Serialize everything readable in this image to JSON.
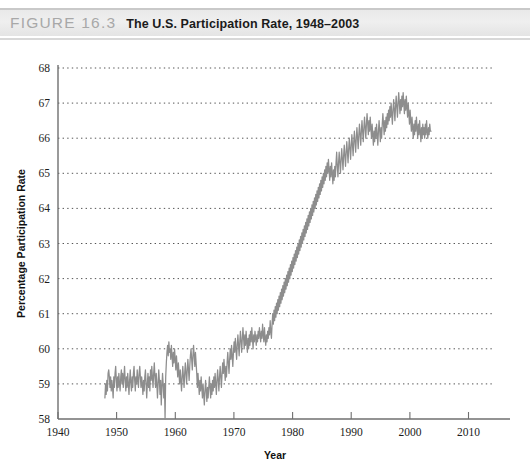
{
  "figure": {
    "label": "FIGURE 16.3",
    "title": "The U.S. Participation Rate, 1948–2003"
  },
  "colors": {
    "line": "#8d8d8d",
    "axis": "#6f6f6f",
    "grid": "#555555",
    "header_bg": "#ebebeb",
    "label_gray": "#a8a8a8",
    "text": "#1c1c1c"
  },
  "chart_data": {
    "type": "line",
    "title": "The U.S. Participation Rate, 1948–2003",
    "xlabel": "Year",
    "ylabel": "Percentage Participation Rate",
    "xlim": [
      1940,
      2014
    ],
    "ylim": [
      58,
      68
    ],
    "xticks": [
      1940,
      1950,
      1960,
      1970,
      1980,
      1990,
      2000,
      2010
    ],
    "yticks": [
      58,
      59,
      60,
      61,
      62,
      63,
      64,
      65,
      66,
      67,
      68
    ],
    "grid": "horizontal-dotted",
    "legend": "none",
    "series": [
      {
        "name": "U.S. Labor Force Participation Rate",
        "units": "percent",
        "x_start": 1948.0,
        "x_end": 2003.6,
        "x_step": 0.0833,
        "values": [
          58.6,
          59.0,
          58.7,
          59.1,
          58.8,
          59.3,
          59.4,
          59.2,
          58.9,
          59.2,
          58.8,
          59.1,
          58.9,
          58.6,
          59.2,
          58.9,
          59.3,
          59.5,
          59.1,
          58.8,
          59.2,
          58.9,
          59.3,
          59.0,
          58.8,
          59.2,
          59.4,
          59.0,
          59.3,
          58.9,
          59.2,
          59.5,
          59.1,
          58.8,
          59.2,
          58.9,
          59.3,
          59.0,
          58.7,
          59.1,
          59.4,
          59.0,
          58.8,
          59.2,
          58.9,
          59.3,
          59.5,
          59.1,
          58.8,
          59.2,
          59.0,
          59.4,
          59.1,
          58.9,
          59.3,
          59.5,
          59.2,
          58.9,
          59.2,
          59.0,
          58.7,
          59.1,
          58.8,
          59.2,
          59.4,
          59.0,
          58.6,
          59.0,
          59.3,
          58.9,
          59.2,
          58.8,
          59.4,
          59.1,
          59.5,
          59.2,
          58.9,
          59.3,
          59.6,
          59.2,
          58.9,
          59.3,
          59.0,
          58.6,
          59.0,
          59.4,
          59.1,
          58.7,
          59.1,
          58.4,
          58.9,
          59.3,
          59.0,
          58.6,
          59.0,
          58.0,
          59.2,
          59.6,
          59.9,
          60.1,
          59.8,
          60.2,
          59.9,
          60.0,
          59.7,
          60.1,
          59.8,
          59.5,
          59.9,
          59.6,
          60.0,
          59.7,
          59.4,
          59.8,
          59.5,
          59.2,
          59.6,
          59.3,
          59.0,
          59.4,
          59.1,
          58.8,
          59.2,
          59.5,
          59.2,
          58.9,
          59.3,
          59.6,
          59.3,
          59.0,
          59.4,
          59.7,
          59.4,
          59.1,
          59.5,
          59.8,
          60.0,
          59.7,
          59.4,
          59.8,
          60.1,
          59.8,
          59.5,
          59.9,
          59.6,
          59.3,
          58.9,
          59.3,
          59.0,
          58.7,
          59.1,
          58.8,
          59.2,
          58.9,
          58.6,
          59.0,
          58.7,
          58.4,
          58.8,
          59.1,
          58.8,
          58.5,
          58.9,
          58.6,
          58.9,
          59.2,
          58.9,
          58.6,
          59.0,
          58.7,
          59.1,
          58.8,
          59.2,
          58.9,
          59.3,
          59.0,
          58.7,
          59.1,
          59.4,
          59.1,
          58.8,
          59.2,
          59.5,
          59.2,
          58.9,
          59.3,
          59.6,
          59.3,
          59.7,
          59.4,
          59.1,
          59.5,
          59.2,
          59.6,
          59.9,
          59.6,
          59.3,
          59.7,
          60.0,
          59.7,
          60.1,
          59.8,
          59.5,
          59.9,
          60.2,
          59.9,
          60.3,
          60.0,
          59.7,
          60.1,
          60.4,
          60.1,
          59.8,
          60.2,
          60.5,
          60.2,
          59.9,
          60.3,
          60.6,
          60.3,
          60.0,
          60.4,
          60.1,
          60.5,
          60.2,
          59.9,
          60.3,
          60.0,
          60.4,
          60.1,
          60.5,
          60.2,
          60.6,
          60.3,
          60.0,
          60.4,
          60.2,
          60.5,
          60.3,
          60.1,
          60.4,
          60.2,
          60.5,
          60.3,
          60.6,
          60.4,
          60.2,
          60.5,
          60.3,
          60.7,
          60.4,
          60.2,
          60.6,
          60.3,
          60.1,
          60.4,
          60.2,
          60.5,
          60.3,
          60.6,
          60.4,
          60.8,
          60.5,
          60.3,
          60.7,
          61.0,
          60.7,
          61.1,
          60.8,
          61.2,
          60.9,
          61.3,
          61.0,
          61.4,
          61.1,
          61.5,
          61.2,
          61.6,
          61.3,
          61.7,
          61.4,
          61.8,
          61.5,
          61.9,
          61.6,
          62.0,
          61.7,
          62.1,
          61.8,
          62.2,
          61.9,
          62.3,
          62.0,
          62.4,
          62.1,
          62.5,
          62.2,
          62.6,
          62.3,
          62.7,
          62.4,
          62.8,
          62.5,
          62.9,
          62.6,
          63.0,
          62.7,
          63.1,
          62.8,
          63.2,
          62.9,
          63.3,
          63.0,
          63.4,
          63.1,
          63.5,
          63.2,
          63.6,
          63.3,
          63.7,
          63.4,
          63.8,
          63.5,
          63.9,
          63.6,
          64.0,
          63.7,
          64.1,
          63.8,
          64.2,
          63.9,
          64.3,
          64.0,
          64.4,
          64.1,
          64.5,
          64.2,
          64.6,
          64.3,
          64.7,
          64.4,
          64.8,
          64.5,
          64.9,
          64.6,
          65.0,
          64.7,
          65.1,
          64.8,
          65.2,
          64.9,
          65.3,
          65.0,
          65.4,
          65.1,
          64.8,
          65.2,
          64.9,
          65.3,
          65.0,
          64.7,
          65.1,
          64.8,
          65.2,
          64.9,
          65.3,
          65.6,
          65.2,
          64.9,
          65.3,
          65.6,
          65.3,
          65.0,
          65.4,
          65.7,
          65.4,
          65.1,
          65.5,
          65.8,
          65.5,
          65.2,
          65.6,
          65.9,
          65.6,
          65.3,
          65.7,
          66.0,
          65.7,
          65.4,
          65.8,
          66.1,
          65.8,
          65.5,
          65.9,
          66.2,
          65.9,
          65.6,
          66.0,
          66.3,
          66.0,
          65.7,
          66.1,
          66.4,
          66.1,
          65.8,
          66.2,
          66.5,
          66.2,
          65.9,
          66.3,
          66.6,
          66.3,
          66.0,
          66.4,
          66.7,
          66.4,
          66.1,
          66.5,
          66.2,
          66.6,
          66.3,
          66.0,
          66.4,
          66.1,
          65.8,
          66.2,
          65.9,
          66.3,
          66.0,
          66.4,
          66.1,
          65.8,
          66.2,
          66.5,
          66.2,
          65.9,
          66.3,
          66.0,
          66.4,
          66.7,
          66.4,
          66.1,
          66.5,
          66.2,
          66.6,
          66.3,
          66.7,
          66.4,
          66.8,
          66.5,
          66.9,
          66.6,
          67.0,
          66.7,
          66.4,
          66.8,
          67.1,
          66.8,
          66.5,
          66.9,
          67.2,
          66.9,
          66.6,
          67.0,
          67.3,
          67.0,
          66.7,
          67.1,
          66.8,
          67.2,
          66.9,
          67.3,
          67.0,
          66.7,
          67.1,
          66.8,
          67.2,
          66.9,
          66.6,
          67.0,
          66.7,
          66.4,
          66.8,
          66.5,
          66.2,
          66.6,
          66.3,
          66.0,
          66.4,
          66.1,
          66.5,
          66.2,
          66.6,
          66.3,
          66.0,
          66.4,
          66.1,
          66.5,
          66.2,
          65.9,
          66.3,
          66.0,
          66.4,
          66.1,
          66.3,
          66.0,
          66.4,
          66.1,
          66.5,
          66.2,
          66.0,
          66.3,
          66.1,
          66.4,
          66.2,
          66.2
        ]
      }
    ]
  }
}
